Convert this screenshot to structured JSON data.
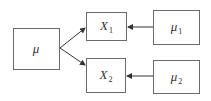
{
  "nodes": {
    "mu": {
      "label": "μ",
      "sub": ""
    },
    "x1": {
      "label": "X",
      "sub": "1"
    },
    "x2": {
      "label": "X",
      "sub": "2"
    },
    "mu1": {
      "label": "μ",
      "sub": "1"
    },
    "mu2": {
      "label": "μ",
      "sub": "2"
    }
  },
  "edges": [
    {
      "from": "mu",
      "to": "x1"
    },
    {
      "from": "mu",
      "to": "x2"
    },
    {
      "from": "mu1",
      "to": "x1"
    },
    {
      "from": "mu2",
      "to": "x2"
    }
  ],
  "colors": {
    "line": "#333333",
    "border": "#6a6a6a"
  }
}
